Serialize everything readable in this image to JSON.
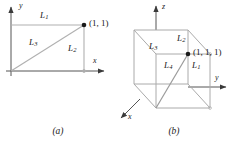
{
  "figure": {
    "background_color": "#ffffff",
    "line_color": "#a8a8a8",
    "axis_color": "#555555",
    "text_color": "#1a1a1a",
    "point_color": "#1a1a1a"
  },
  "panel_a": {
    "caption": "(a)",
    "axes": [
      {
        "name": "x",
        "label": "x",
        "direction": "right"
      },
      {
        "name": "y",
        "label": "y",
        "direction": "up"
      }
    ],
    "point": {
      "label": "(1, 1)",
      "coordinates": [
        1,
        1
      ]
    },
    "segments": [
      {
        "label": "L",
        "sub": "1",
        "from": [
          0,
          1
        ],
        "to": [
          1,
          1
        ],
        "description": "horizontal segment at y=1"
      },
      {
        "label": "L",
        "sub": "2",
        "from": [
          1,
          0
        ],
        "to": [
          1,
          1
        ],
        "description": "vertical segment at x=1"
      },
      {
        "label": "L",
        "sub": "3",
        "from": [
          0,
          0
        ],
        "to": [
          1,
          1
        ],
        "description": "diagonal from origin"
      }
    ]
  },
  "panel_b": {
    "caption": "(b)",
    "axes": [
      {
        "name": "x",
        "label": "x",
        "direction": "front-left"
      },
      {
        "name": "y",
        "label": "y",
        "direction": "right"
      },
      {
        "name": "z",
        "label": "z",
        "direction": "up"
      }
    ],
    "point": {
      "label": "(1, 1, 1)",
      "coordinates": [
        1,
        1,
        1
      ]
    },
    "segments": [
      {
        "label": "L",
        "sub": "1",
        "from": [
          1,
          1,
          0
        ],
        "to": [
          1,
          1,
          1
        ],
        "description": "vertical edge"
      },
      {
        "label": "L",
        "sub": "2",
        "from": [
          0,
          1,
          1
        ],
        "to": [
          1,
          1,
          1
        ],
        "description": "top edge toward y"
      },
      {
        "label": "L",
        "sub": "3",
        "from": [
          1,
          0,
          1
        ],
        "to": [
          1,
          1,
          1
        ],
        "description": "top edge toward x"
      },
      {
        "label": "L",
        "sub": "4",
        "from": [
          0,
          0,
          0
        ],
        "to": [
          1,
          1,
          1
        ],
        "description": "main diagonal of the cube"
      }
    ],
    "shape": "unit cube"
  }
}
